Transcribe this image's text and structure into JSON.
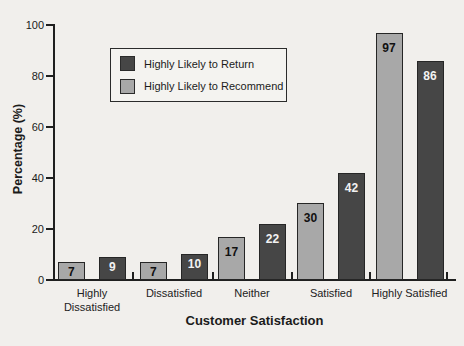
{
  "colors": {
    "background": "#f1efec",
    "axis": "#1f1f1f",
    "bar_light": "#a8a8a8",
    "bar_dark": "#464646",
    "value_on_light": "#111111",
    "value_on_dark": "#f2f2f2"
  },
  "chart_data": {
    "type": "bar",
    "title": "",
    "xlabel": "Customer Satisfaction",
    "ylabel": "Percentage (%)",
    "ylim": [
      0,
      100
    ],
    "yticks": [
      0,
      20,
      40,
      60,
      80,
      100
    ],
    "grid": false,
    "legend_position": "inside-upper-left",
    "categories": [
      "Highly Dissatisfied",
      "Dissatisfied",
      "Neither",
      "Satisfied",
      "Highly Satisfied"
    ],
    "series": [
      {
        "name": "Highly Likely to Recommend",
        "color": "#a8a8a8",
        "values": [
          7,
          7,
          17,
          30,
          97
        ]
      },
      {
        "name": "Highly Likely to Return",
        "color": "#464646",
        "values": [
          9,
          10,
          22,
          42,
          86
        ]
      }
    ]
  },
  "legend": {
    "items": [
      {
        "label": "Highly Likely to Return",
        "color": "#464646"
      },
      {
        "label": "Highly Likely to Recommend",
        "color": "#a8a8a8"
      }
    ]
  }
}
